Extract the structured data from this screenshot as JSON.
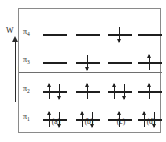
{
  "figure": {
    "kind": "molecular-orbital-energy-level-diagram",
    "axis": {
      "label": "W",
      "zero_label": "0",
      "direction": "up",
      "arrow_icon": "up-arrow-icon"
    },
    "levels": [
      {
        "id": "pi4",
        "symbol": "π",
        "subscript": "4",
        "label": "π4",
        "energy_sign": "antibonding"
      },
      {
        "id": "pi3",
        "symbol": "π",
        "subscript": "3",
        "label": "π3",
        "energy_sign": "antibonding"
      },
      {
        "id": "pi2",
        "symbol": "π",
        "subscript": "2",
        "label": "π2",
        "energy_sign": "bonding"
      },
      {
        "id": "pi1",
        "symbol": "π",
        "subscript": "1",
        "label": "π1",
        "energy_sign": "bonding"
      }
    ],
    "columns": [
      {
        "id": "a",
        "caption": "(a)"
      },
      {
        "id": "b",
        "caption": "(b)"
      },
      {
        "id": "c",
        "caption": "(c)"
      },
      {
        "id": "d",
        "caption": "(d)"
      }
    ],
    "occupancy": {
      "pi4": {
        "a": [],
        "b": [],
        "c": [
          "down"
        ],
        "d": []
      },
      "pi3": {
        "a": [],
        "b": [
          "down"
        ],
        "c": [],
        "d": [
          "up"
        ]
      },
      "pi2": {
        "a": [
          "up",
          "down"
        ],
        "b": [
          "up"
        ],
        "c": [
          "up",
          "down"
        ],
        "d": [
          "up"
        ]
      },
      "pi1": {
        "a": [
          "up",
          "down"
        ],
        "b": [
          "up",
          "down"
        ],
        "c": [
          "up"
        ],
        "d": [
          "up",
          "down"
        ]
      }
    },
    "colors": {
      "frame_border": "#8a8a8a",
      "zero_line": "#6e6e6e",
      "orbital_line": "#1f1f1f",
      "arrow": "#1f1f1f",
      "axis": "#2b2b2b",
      "background": "#ffffff"
    }
  }
}
